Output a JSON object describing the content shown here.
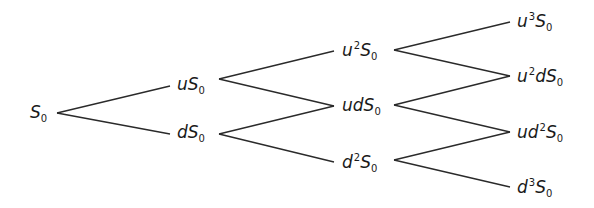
{
  "diagram": {
    "type": "binomial-tree",
    "colors": {
      "line": "#2a2a2a",
      "text": "#1a1a1a",
      "background": "#ffffff"
    },
    "nodes": [
      {
        "id": "n0",
        "base": "S",
        "prefix": "",
        "prefix_parts": [],
        "sub": "0",
        "x": 30,
        "y": 114,
        "level": 0
      },
      {
        "id": "n1u",
        "prefix_parts": [
          {
            "t": "u",
            "p": ""
          }
        ],
        "base": "S",
        "sub": "0",
        "x": 177,
        "y": 86,
        "level": 1
      },
      {
        "id": "n1d",
        "prefix_parts": [
          {
            "t": "d",
            "p": ""
          }
        ],
        "base": "S",
        "sub": "0",
        "x": 177,
        "y": 134,
        "level": 1
      },
      {
        "id": "n2uu",
        "prefix_parts": [
          {
            "t": "u",
            "p": "2"
          }
        ],
        "base": "S",
        "sub": "0",
        "x": 342,
        "y": 51,
        "level": 2
      },
      {
        "id": "n2ud",
        "prefix_parts": [
          {
            "t": "ud",
            "p": ""
          }
        ],
        "base": "S",
        "sub": "0",
        "x": 342,
        "y": 107,
        "level": 2
      },
      {
        "id": "n2dd",
        "prefix_parts": [
          {
            "t": "d",
            "p": "2"
          }
        ],
        "base": "S",
        "sub": "0",
        "x": 342,
        "y": 163,
        "level": 2
      },
      {
        "id": "n3uuu",
        "prefix_parts": [
          {
            "t": "u",
            "p": "3"
          }
        ],
        "base": "S",
        "sub": "0",
        "x": 517,
        "y": 22,
        "level": 3
      },
      {
        "id": "n3uud",
        "prefix_parts": [
          {
            "t": "u",
            "p": "2"
          },
          {
            "t": "d",
            "p": ""
          }
        ],
        "base": "S",
        "sub": "0",
        "x": 517,
        "y": 77,
        "level": 3
      },
      {
        "id": "n3udd",
        "prefix_parts": [
          {
            "t": "ud",
            "p": "2"
          }
        ],
        "base": "S",
        "sub": "0",
        "x": 517,
        "y": 133,
        "level": 3
      },
      {
        "id": "n3ddd",
        "prefix_parts": [
          {
            "t": "d",
            "p": "3"
          }
        ],
        "base": "S",
        "sub": "0",
        "x": 517,
        "y": 188,
        "level": 3
      }
    ],
    "labels": {
      "n0": "S0",
      "n1u": "uS0",
      "n1d": "dS0",
      "n2uu": "u^2S0",
      "n2ud": "udS0",
      "n2dd": "d^2S0",
      "n3uuu": "u^3S0",
      "n3uud": "u^2dS0",
      "n3udd": "ud^2S0",
      "n3ddd": "d^3S0"
    },
    "edges": [
      {
        "from": "n0",
        "to": "n1u",
        "x1": 57,
        "y1": 113,
        "x2": 170,
        "y2": 86
      },
      {
        "from": "n0",
        "to": "n1d",
        "x1": 57,
        "y1": 113,
        "x2": 170,
        "y2": 134
      },
      {
        "from": "n1u",
        "to": "n2uu",
        "x1": 219,
        "y1": 79,
        "x2": 334,
        "y2": 51
      },
      {
        "from": "n1u",
        "to": "n2ud",
        "x1": 219,
        "y1": 79,
        "x2": 334,
        "y2": 106
      },
      {
        "from": "n1d",
        "to": "n2ud",
        "x1": 219,
        "y1": 134,
        "x2": 334,
        "y2": 106
      },
      {
        "from": "n1d",
        "to": "n2dd",
        "x1": 219,
        "y1": 134,
        "x2": 334,
        "y2": 162
      },
      {
        "from": "n2uu",
        "to": "n3uuu",
        "x1": 394,
        "y1": 50,
        "x2": 510,
        "y2": 22
      },
      {
        "from": "n2uu",
        "to": "n3uud",
        "x1": 394,
        "y1": 50,
        "x2": 510,
        "y2": 76
      },
      {
        "from": "n2ud",
        "to": "n3uud",
        "x1": 394,
        "y1": 105,
        "x2": 510,
        "y2": 76
      },
      {
        "from": "n2ud",
        "to": "n3udd",
        "x1": 394,
        "y1": 105,
        "x2": 510,
        "y2": 132
      },
      {
        "from": "n2dd",
        "to": "n3udd",
        "x1": 394,
        "y1": 160,
        "x2": 510,
        "y2": 132
      },
      {
        "from": "n2dd",
        "to": "n3ddd",
        "x1": 394,
        "y1": 160,
        "x2": 510,
        "y2": 187
      }
    ]
  }
}
